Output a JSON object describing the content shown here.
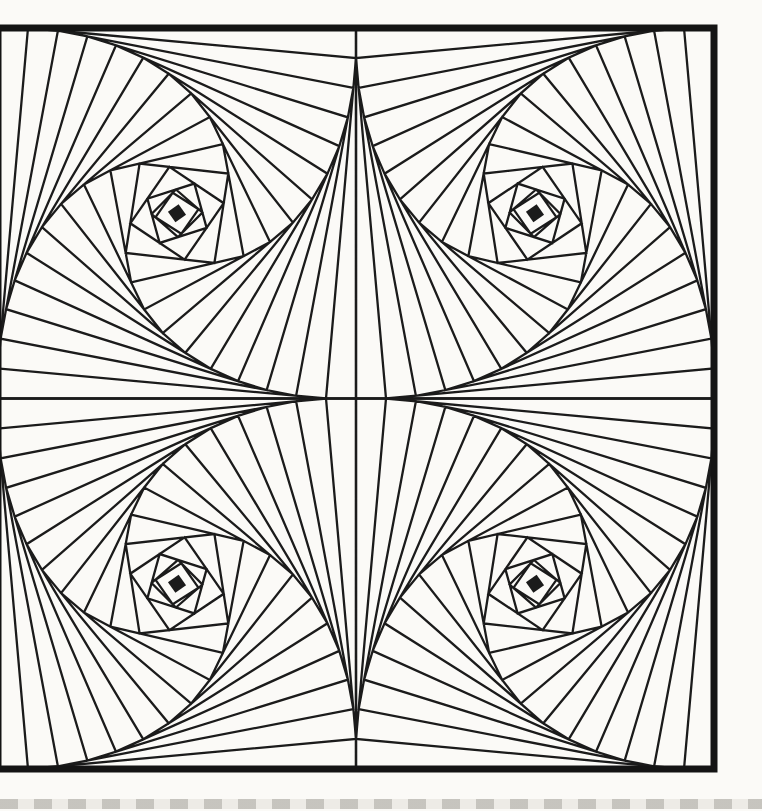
{
  "artwork": {
    "description": "scanned-book-page-pursuit-curve-string-art-panel",
    "canvas": {
      "width": 762,
      "height": 811
    },
    "page_background": "#fbfaf7",
    "ink_color": "#1b1b1b",
    "line_stroke_width": 2.3,
    "border": {
      "x": -2,
      "y": 28,
      "width": 716,
      "height": 741,
      "stroke_width": 7,
      "color": "#141414"
    },
    "midlines": {
      "vertical_x": 356,
      "horizontal_y": 398.5
    },
    "pursuit": {
      "step_px": 30,
      "max_iterations": 40,
      "stop_margin_px": 2.5,
      "tiles": [
        {
          "name": "top-left",
          "corners": [
            [
              -2,
              28
            ],
            [
              356,
              28
            ],
            [
              356,
              398.5
            ],
            [
              -2,
              398.5
            ]
          ]
        },
        {
          "name": "top-right",
          "corners": [
            [
              714,
              28
            ],
            [
              356,
              28
            ],
            [
              356,
              398.5
            ],
            [
              714,
              398.5
            ]
          ]
        },
        {
          "name": "bottom-left",
          "corners": [
            [
              -2,
              769
            ],
            [
              356,
              769
            ],
            [
              356,
              398.5
            ],
            [
              -2,
              398.5
            ]
          ]
        },
        {
          "name": "bottom-right",
          "corners": [
            [
              356,
              398.5
            ],
            [
              714,
              398.5
            ],
            [
              714,
              769
            ],
            [
              356,
              769
            ]
          ]
        }
      ],
      "core_dot": {
        "size": 13,
        "rotation_deg": 55
      }
    },
    "bottom_strip": {
      "y": 799,
      "height": 10,
      "base_color": "#edebe6",
      "dash_color": "rgba(152,150,143,0.45)",
      "dash_px": 18,
      "gap_px": 16
    }
  }
}
